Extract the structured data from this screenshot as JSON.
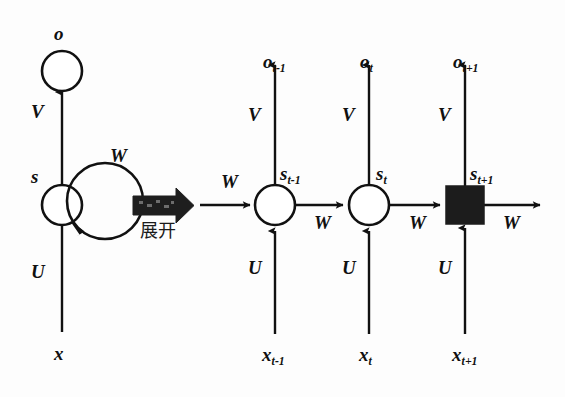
{
  "diagram": {
    "background_color": "#fdfdfd",
    "stroke_color": "#111111",
    "node_fill_color": "#ffffff",
    "square_fill_color": "#1c1c1c",
    "unfold_arrow_color": "#1a1a1a"
  },
  "folded": {
    "output_label": "o",
    "state_label": "s",
    "input_label": "x",
    "weight_v": "V",
    "weight_u": "U",
    "weight_w": "W"
  },
  "transition": {
    "caption": "展开",
    "arrow_name": "unfold-arrow"
  },
  "unfolded": {
    "left_weight_w": "W",
    "right_weight_w": "W",
    "steps": [
      {
        "output": "o",
        "output_sub": "t-1",
        "state": "s",
        "state_sub": "t-1",
        "input": "x",
        "input_sub": "t-1",
        "weight_v": "V",
        "weight_u": "U",
        "weight_w": "W",
        "node_shape": "circle"
      },
      {
        "output": "o",
        "output_sub": "t",
        "state": "s",
        "state_sub": "t",
        "input": "x",
        "input_sub": "t",
        "weight_v": "V",
        "weight_u": "U",
        "weight_w": "W",
        "node_shape": "circle"
      },
      {
        "output": "o",
        "output_sub": "t+1",
        "state": "s",
        "state_sub": "t+1",
        "input": "x",
        "input_sub": "t+1",
        "weight_v": "V",
        "weight_u": "U",
        "weight_w": "W",
        "node_shape": "filled-square"
      }
    ]
  }
}
